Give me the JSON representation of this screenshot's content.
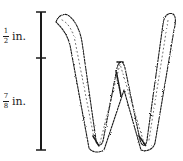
{
  "figure": {
    "glyph_letter": "W",
    "scale_bar": {
      "segments": [
        {
          "numerator": "1",
          "denominator": "2",
          "unit": "in.",
          "label": "½ in."
        },
        {
          "numerator": "7",
          "denominator": "8",
          "unit": "in.",
          "label": "⅞ in."
        }
      ]
    },
    "colors": {
      "ink": "#1a1a1a",
      "background": "#ffffff"
    }
  }
}
